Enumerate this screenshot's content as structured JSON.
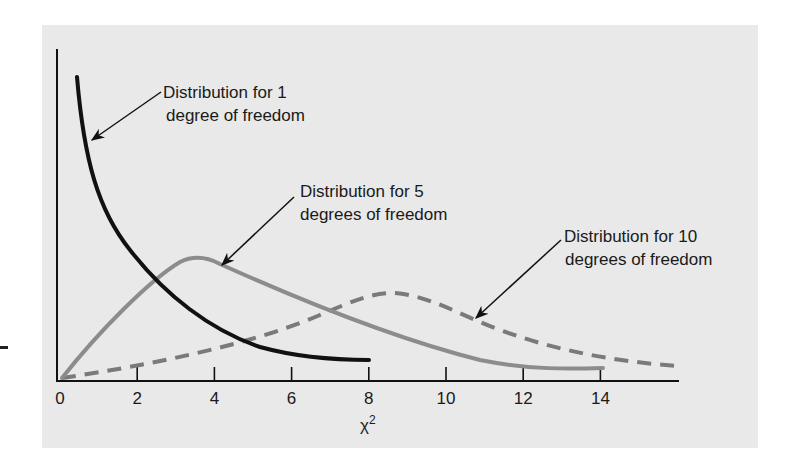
{
  "chart_data": {
    "type": "line",
    "title": "",
    "xlabel": "χ²",
    "xlabel_base": "χ",
    "xlabel_sup": "2",
    "ylabel": "",
    "xlim": [
      0,
      16
    ],
    "x_ticks": [
      0,
      2,
      4,
      6,
      8,
      10,
      12,
      14
    ],
    "x_tick_labels": [
      "0",
      "2",
      "4",
      "6",
      "8",
      "10",
      "12",
      "14"
    ],
    "grid": false,
    "legend": "none (inline annotations with arrows)",
    "series": [
      {
        "name": "Distribution for 1 degree of freedom",
        "df": 1,
        "style": "solid black thick",
        "color": "#111111",
        "x_range": [
          0.4,
          8
        ]
      },
      {
        "name": "Distribution for 5 degrees of freedom",
        "df": 5,
        "style": "solid gray",
        "color": "#8a8a8a",
        "x_range": [
          0,
          14
        ],
        "peak_x": 3.5
      },
      {
        "name": "Distribution for 10 degrees of freedom",
        "df": 10,
        "style": "dashed gray",
        "color": "#7a7a7a",
        "x_range": [
          0,
          16
        ],
        "peak_x": 8.5
      }
    ],
    "annotations": [
      {
        "line1": "Distribution for 1",
        "line2": "degree of freedom"
      },
      {
        "line1": "Distribution for 5",
        "line2": "degrees of freedom"
      },
      {
        "line1": "Distribution for 10",
        "line2": "degrees of freedom"
      }
    ]
  },
  "colors": {
    "panel_bg": "#e9e9e9",
    "axis": "#111111",
    "df1": "#111111",
    "df5": "#8c8c8c",
    "df10": "#7a7a7a"
  }
}
